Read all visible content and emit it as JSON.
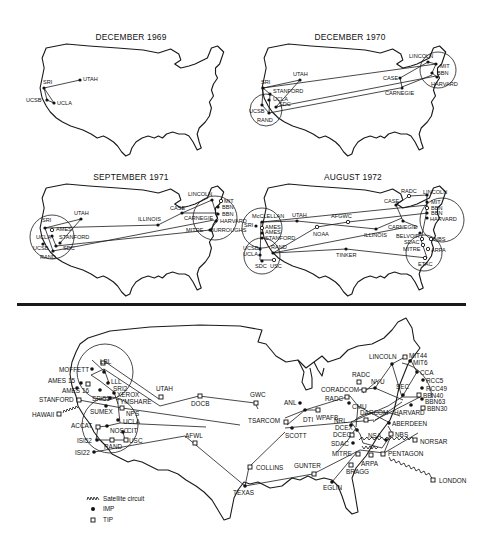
{
  "figure": {
    "panels": [
      {
        "title": "DECEMBER 1969",
        "nodes": [
          "SRI",
          "UTAH",
          "UCSB",
          "UCLA"
        ]
      },
      {
        "title": "DECEMBER 1970",
        "nodes": [
          "SRI",
          "UTAH",
          "STANFORD",
          "UCLA",
          "SDC",
          "UCSB",
          "RAND",
          "CASE",
          "CARNEGIE",
          "LINCOLN",
          "MIT",
          "BBN",
          "HARVARD"
        ]
      },
      {
        "title": "SEPTEMBER 1971",
        "nodes": [
          "SRI",
          "AMES",
          "UCLA",
          "STANFORD",
          "UCSB",
          "SDC",
          "RAND",
          "UTAH",
          "ILLINOIS",
          "CASE",
          "LINCOLN",
          "CARNEGIE",
          "MITRE",
          "MIT",
          "BBN",
          "BBN",
          "HARVARD",
          "BURROUGHS"
        ]
      },
      {
        "title": "AUGUST 1972",
        "nodes": [
          "McCLELLAN",
          "SRI",
          "AMES",
          "AMES",
          "STANFORD",
          "UCSB",
          "UCLA",
          "RAND",
          "SDC",
          "USC",
          "UTAH",
          "AFGWC",
          "NOAA",
          "ILLINOIS",
          "TINKER",
          "CASE",
          "RADC",
          "CARNEGIE",
          "BELVOIR",
          "SDAC",
          "MITRE",
          "ETAC",
          "LINCOLN",
          "MIT",
          "BBN",
          "BBN",
          "HARVARD",
          "NBS",
          "ARPA"
        ]
      }
    ],
    "large_map": {
      "west": [
        "MOFFETT",
        "LBL",
        "AMES 15",
        "AMES 16",
        "LLL",
        "SRI2",
        "XEROX",
        "SRI51",
        "TYMSHARE",
        "STANFORD",
        "HAWAII",
        "SUMEX",
        "NPS",
        "UCLA",
        "ACCAT",
        "NOSC",
        "CIT",
        "ISI52",
        "RAND",
        "USC",
        "ISI22"
      ],
      "central": [
        "UTAH",
        "DOCB",
        "GWC",
        "ANL",
        "DTI",
        "TSARCOM",
        "SCOTT",
        "AFWL",
        "COLLINS",
        "TEXAS",
        "GUNTER",
        "EGLIN",
        "WPAFB"
      ],
      "east": [
        "LINCOLN",
        "MIT44",
        "MIT6",
        "CCA",
        "RCC5",
        "RCC49",
        "BBN40",
        "BBN63",
        "BBN30",
        "RADC",
        "CORADCOM",
        "RADC",
        "NYU",
        "SEC",
        "CMU",
        "HARVARD",
        "DARCOM",
        "ABERDEEN",
        "NRL",
        "DCEX",
        "DCEC",
        "NBS",
        "NSA",
        "SDAC",
        "NORSAR",
        "MITRE",
        "PENTAGON",
        "ARPA",
        "BRAGG",
        "LONDON"
      ]
    },
    "legend": {
      "items": [
        {
          "symbol": "zigzag",
          "label": "Satellite circuit"
        },
        {
          "symbol": "filled-circle",
          "label": "IMP"
        },
        {
          "symbol": "open-square",
          "label": "TIP"
        }
      ]
    }
  }
}
